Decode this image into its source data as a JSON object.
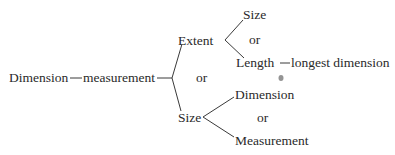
{
  "diagram": {
    "root": "Dimension",
    "root_link": "measurement",
    "branch_top": {
      "label": "Extent",
      "child_top": "Size",
      "connector": "or",
      "child_bottom": "Length",
      "child_bottom_note": "longest dimension"
    },
    "branch_connector": "or",
    "branch_bottom": {
      "label": "Size",
      "child_top": "Dimension",
      "connector": "or",
      "child_bottom": "Measurement"
    }
  },
  "colors": {
    "text": "#2a2a2a",
    "line": "#3a3a3a",
    "background": "#ffffff"
  }
}
